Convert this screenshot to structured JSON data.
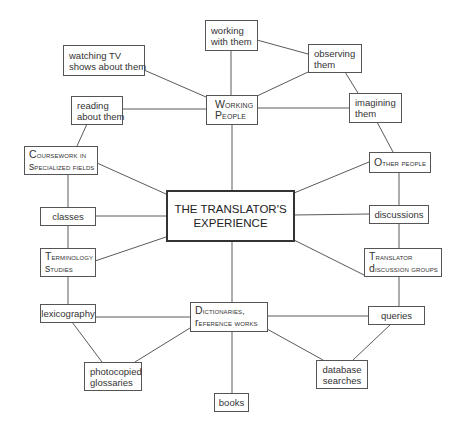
{
  "diagram": {
    "title": "THE TRANSLATOR'S EXPERIENCE",
    "center": {
      "line1": "THE TRANSLATOR'S",
      "line2": "EXPERIENCE"
    },
    "nodes": {
      "working_with_them": {
        "line1": "working",
        "line2": "with them"
      },
      "watching_tv": {
        "line1": "watching TV",
        "line2": "shows about them"
      },
      "observing_them": {
        "line1": "observing",
        "line2": "them"
      },
      "reading_about_them": {
        "line1": "reading",
        "line2": "about them"
      },
      "working_people": {
        "line1": "Working",
        "line2": "People"
      },
      "imagining_them": {
        "line1": "imagining",
        "line2": "them"
      },
      "coursework": {
        "line1": "Coursework in",
        "line2": "specialized fields"
      },
      "other_people": {
        "line1": "Other people"
      },
      "classes": {
        "line1": "classes"
      },
      "discussions": {
        "line1": "discussions"
      },
      "terminology_studies": {
        "line1": "Terminology",
        "line2": "studies"
      },
      "translator_discussion_groups": {
        "line1": "Translator",
        "line2": "discussion groups"
      },
      "lexicography": {
        "line1": "lexicography"
      },
      "dictionaries": {
        "line1": "Dictionaries,",
        "line2": "reference works"
      },
      "queries": {
        "line1": "queries"
      },
      "photocopied_glossaries": {
        "line1": "photocopied",
        "line2": "glossaries"
      },
      "database_searches": {
        "line1": "database",
        "line2": "searches"
      },
      "books": {
        "line1": "books"
      }
    },
    "edges": [
      [
        "working_people",
        "center"
      ],
      [
        "working_with_them",
        "working_people"
      ],
      [
        "working_with_them",
        "observing_them"
      ],
      [
        "watching_tv",
        "working_people"
      ],
      [
        "reading_about_them",
        "working_people"
      ],
      [
        "observing_them",
        "working_people"
      ],
      [
        "working_people",
        "imagining_them"
      ],
      [
        "observing_them",
        "imagining_them"
      ],
      [
        "imagining_them",
        "other_people"
      ],
      [
        "reading_about_them",
        "coursework"
      ],
      [
        "coursework",
        "center"
      ],
      [
        "coursework",
        "classes"
      ],
      [
        "classes",
        "center"
      ],
      [
        "classes",
        "terminology_studies"
      ],
      [
        "terminology_studies",
        "center"
      ],
      [
        "terminology_studies",
        "lexicography"
      ],
      [
        "lexicography",
        "dictionaries"
      ],
      [
        "lexicography",
        "photocopied_glossaries"
      ],
      [
        "dictionaries",
        "photocopied_glossaries"
      ],
      [
        "center",
        "dictionaries"
      ],
      [
        "dictionaries",
        "books"
      ],
      [
        "dictionaries",
        "queries"
      ],
      [
        "dictionaries",
        "database_searches"
      ],
      [
        "queries",
        "database_searches"
      ],
      [
        "center",
        "other_people"
      ],
      [
        "center",
        "discussions"
      ],
      [
        "center",
        "translator_discussion_groups"
      ],
      [
        "other_people",
        "discussions"
      ],
      [
        "discussions",
        "translator_discussion_groups"
      ],
      [
        "translator_discussion_groups",
        "queries"
      ]
    ]
  }
}
